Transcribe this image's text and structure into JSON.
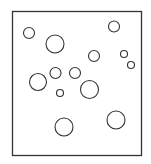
{
  "diagram": {
    "colors": {
      "background": "#ffffff",
      "stroke": "#333333"
    },
    "frame": {
      "x": 12.5,
      "y": 11.5,
      "width": 129,
      "height": 144
    },
    "circles": [
      {
        "cx": 29,
        "cy": 33,
        "r": 5.5
      },
      {
        "cx": 55,
        "cy": 44,
        "r": 9
      },
      {
        "cx": 114,
        "cy": 26.5,
        "r": 5.5
      },
      {
        "cx": 94,
        "cy": 56,
        "r": 5.5
      },
      {
        "cx": 124,
        "cy": 54,
        "r": 3.5
      },
      {
        "cx": 131,
        "cy": 65,
        "r": 3.5
      },
      {
        "cx": 38,
        "cy": 82,
        "r": 8.5
      },
      {
        "cx": 55.5,
        "cy": 73,
        "r": 5.5
      },
      {
        "cx": 75,
        "cy": 73,
        "r": 5.5
      },
      {
        "cx": 60,
        "cy": 93,
        "r": 3.5
      },
      {
        "cx": 89.5,
        "cy": 89.5,
        "r": 9
      },
      {
        "cx": 116,
        "cy": 120,
        "r": 9
      },
      {
        "cx": 64,
        "cy": 127,
        "r": 9
      }
    ]
  }
}
